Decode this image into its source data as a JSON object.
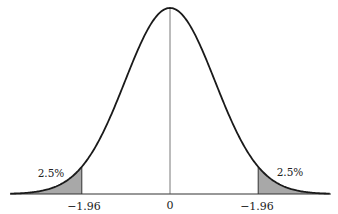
{
  "figure": {
    "center_label": "0",
    "left_critical_label": "−1.96",
    "right_critical_label": "−1.96",
    "left_tail_label": "2.5%",
    "right_tail_label": "2.5%",
    "colors": {
      "curve": "#1a1a1a",
      "tail_fill": "#a8a8a8",
      "axis": "#333333",
      "center_line": "#555555",
      "background": "#ffffff"
    },
    "params": {
      "mean": 0,
      "sd": 1,
      "critical_z": 1.96,
      "z_range": [
        -3.5,
        3.5
      ]
    }
  }
}
